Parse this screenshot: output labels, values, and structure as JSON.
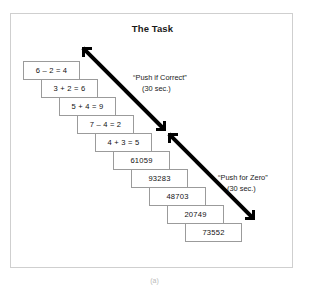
{
  "figure": {
    "title": "The Task",
    "caption": "(a)"
  },
  "stack": {
    "cards": [
      {
        "text": "6 – 2 = 4",
        "left": 23,
        "top": 61
      },
      {
        "text": "3 + 2 = 6",
        "left": 41,
        "top": 79
      },
      {
        "text": "5 + 4 = 9",
        "left": 59,
        "top": 97
      },
      {
        "text": "7 – 4 = 2",
        "left": 77,
        "top": 115
      },
      {
        "text": "4 + 3 = 5",
        "left": 95,
        "top": 133
      },
      {
        "text": "61059",
        "left": 113,
        "top": 151
      },
      {
        "text": "93283",
        "left": 131,
        "top": 169
      },
      {
        "text": "48703",
        "left": 149,
        "top": 187
      },
      {
        "text": "20749",
        "left": 167,
        "top": 205
      },
      {
        "text": "73552",
        "left": 185,
        "top": 223
      }
    ]
  },
  "annotations": {
    "upper": {
      "line1": "“Push if Correct”",
      "line2": "(30 sec.)",
      "left": 133,
      "top": 72
    },
    "lower": {
      "line1": "“Push for Zero”",
      "line2": "(30 sec.)",
      "left": 218,
      "top": 172
    }
  },
  "arrows": {
    "upper": {
      "x1": 83,
      "y1": 48,
      "x2": 164,
      "y2": 129
    },
    "lower": {
      "x1": 169,
      "y1": 134,
      "x2": 253,
      "y2": 218
    }
  },
  "colors": {
    "frame": "#cfcfcf",
    "card_border": "#9b9b9b",
    "arrow": "#000000",
    "text": "#111111",
    "background": "#ffffff"
  }
}
